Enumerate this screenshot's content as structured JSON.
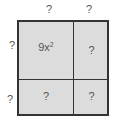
{
  "diagram": {
    "type": "area-model",
    "top_labels": [
      "?",
      "?"
    ],
    "left_labels": [
      "?",
      "?"
    ],
    "cells": [
      {
        "row": 0,
        "col": 0,
        "base": "9x",
        "exponent": "2"
      },
      {
        "row": 0,
        "col": 1,
        "text": "?"
      },
      {
        "row": 1,
        "col": 0,
        "text": "?"
      },
      {
        "row": 1,
        "col": 1,
        "text": "?"
      }
    ],
    "colors": {
      "fill": "#dcdcdc",
      "border": "#333333",
      "text": "#555555"
    }
  }
}
